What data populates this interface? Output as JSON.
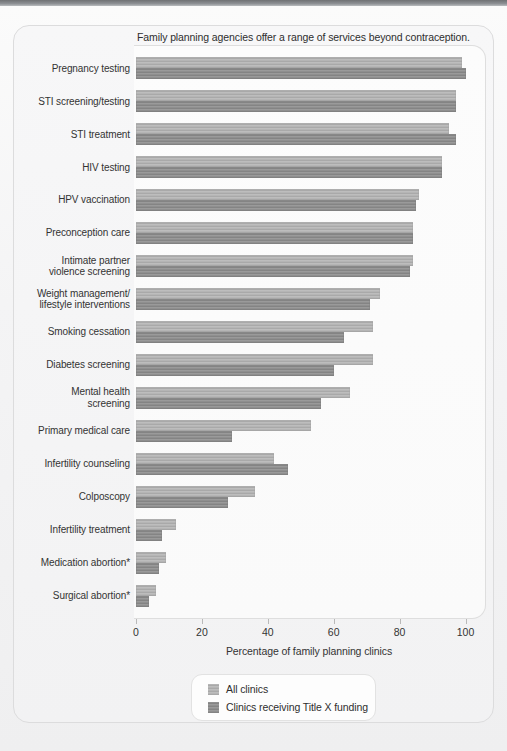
{
  "chart_data": {
    "type": "bar",
    "orientation": "horizontal",
    "grouping": "grouped",
    "title": "Family planning agencies offer a range of services beyond contraception.",
    "xlabel": "Percentage of family planning clinics",
    "ylabel": "",
    "xlim": [
      0,
      105
    ],
    "xticks": [
      0,
      20,
      40,
      60,
      80,
      100
    ],
    "xtick_labels": [
      "0",
      "20",
      "40",
      "60",
      "80",
      "100"
    ],
    "grid": false,
    "legend_position": "bottom-center",
    "categories": [
      "Pregnancy testing",
      "STI screening/testing",
      "STI treatment",
      "HIV testing",
      "HPV vaccination",
      "Preconception care",
      "Intimate partner violence screening",
      "Weight management/ lifestyle interventions",
      "Smoking cessation",
      "Diabetes screening",
      "Mental health screening",
      "Primary medical care",
      "Infertility counseling",
      "Colposcopy",
      "Infertility treatment",
      "Medication abortion*",
      "Surgical abortion*"
    ],
    "category_lines": [
      [
        "Pregnancy testing"
      ],
      [
        "STI screening/testing"
      ],
      [
        "STI treatment"
      ],
      [
        "HIV testing"
      ],
      [
        "HPV vaccination"
      ],
      [
        "Preconception care"
      ],
      [
        "Intimate partner",
        "violence screening"
      ],
      [
        "Weight management/",
        "lifestyle interventions"
      ],
      [
        "Smoking cessation"
      ],
      [
        "Diabetes screening"
      ],
      [
        "Mental health",
        "screening"
      ],
      [
        "Primary medical care"
      ],
      [
        "Infertility counseling"
      ],
      [
        "Colposcopy"
      ],
      [
        "Infertility treatment"
      ],
      [
        "Medication abortion*"
      ],
      [
        "Surgical abortion*"
      ]
    ],
    "series": [
      {
        "name": "All clinics",
        "color": "#b5b5b5",
        "values": [
          99,
          97,
          95,
          93,
          86,
          84,
          84,
          74,
          72,
          72,
          65,
          53,
          42,
          36,
          12,
          9,
          6
        ]
      },
      {
        "name": "Clinics receiving Title X funding",
        "color": "#8f8f8f",
        "values": [
          100,
          97,
          97,
          93,
          85,
          84,
          83,
          71,
          63,
          60,
          56,
          29,
          46,
          28,
          8,
          7,
          4
        ]
      }
    ],
    "legend_entries": [
      "All clinics",
      "Clinics receiving Title X funding"
    ]
  }
}
